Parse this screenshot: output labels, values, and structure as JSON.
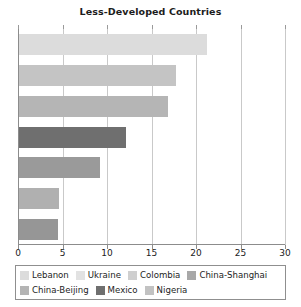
{
  "chart_data": {
    "type": "bar",
    "orientation": "horizontal",
    "title": "Less-Developed Countries",
    "xlabel": "",
    "ylabel": "",
    "xlim": [
      0,
      30
    ],
    "xticks": [
      0,
      5,
      10,
      15,
      20,
      25,
      30
    ],
    "xticklabels": [
      "0",
      "5",
      "10",
      "15",
      "20",
      "25",
      "30"
    ],
    "grid": true,
    "grid_axis": "x",
    "legend_position": "bottom",
    "categories": [
      "Lebanon",
      "Ukraine",
      "Colombia",
      "China-Shanghai",
      "China-Beijing",
      "Mexico",
      "Nigeria"
    ],
    "values": [
      21.2,
      17.8,
      16.9,
      12.1,
      9.2,
      4.6,
      4.5
    ],
    "colors": [
      "#dcdcdc",
      "#c4c4c4",
      "#b5b5b5",
      "#6f6f6f",
      "#9a9a9a",
      "#b0b0b0",
      "#969696"
    ],
    "series": [
      {
        "name": "Less-Developed Countries",
        "values": [
          21.2,
          17.8,
          16.9,
          12.1,
          9.2,
          4.6,
          4.5
        ]
      }
    ],
    "bars": [
      {
        "label": "Lebanon",
        "value": 21.2,
        "color": "#dcdcdc"
      },
      {
        "label": "Ukraine",
        "value": 17.8,
        "color": "#c4c4c4"
      },
      {
        "label": "Colombia",
        "value": 16.9,
        "color": "#b5b5b5"
      },
      {
        "label": "China-Shanghai",
        "value": 12.1,
        "color": "#6f6f6f"
      },
      {
        "label": "China-Beijing",
        "value": 9.2,
        "color": "#9a9a9a"
      },
      {
        "label": "Mexico",
        "value": 4.6,
        "color": "#b0b0b0"
      },
      {
        "label": "Nigeria",
        "value": 4.5,
        "color": "#969696"
      }
    ]
  },
  "legend": {
    "row1": [
      {
        "label": "Lebanon",
        "color": "#dcdcdc"
      },
      {
        "label": "Ukraine",
        "color": "#e2e2e2"
      },
      {
        "label": "Colombia",
        "color": "#cfcfcf"
      },
      {
        "label": "China-Shanghai",
        "color": "#a8a8a8"
      }
    ],
    "row2": [
      {
        "label": "China-Beijing",
        "color": "#b4b4b4"
      },
      {
        "label": "Mexico",
        "color": "#6f6f6f"
      },
      {
        "label": "Nigeria",
        "color": "#c2c2c2"
      }
    ]
  }
}
